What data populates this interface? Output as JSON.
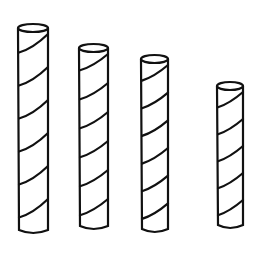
{
  "figure": {
    "description": "Line drawing of four vertical striped rods of decreasing height",
    "stroke_color": "#111111",
    "background": "#ffffff",
    "rods": [
      {
        "label": "rod-1",
        "x": 18,
        "width": 30,
        "top": 28,
        "bottom": 230,
        "stripes": 6
      },
      {
        "label": "rod-2",
        "x": 79,
        "width": 29,
        "top": 48,
        "bottom": 226,
        "stripes": 6
      },
      {
        "label": "rod-3",
        "x": 141,
        "width": 27,
        "top": 59,
        "bottom": 229,
        "stripes": 6
      },
      {
        "label": "rod-4",
        "x": 217,
        "width": 26,
        "top": 86,
        "bottom": 225,
        "stripes": 5
      }
    ]
  }
}
